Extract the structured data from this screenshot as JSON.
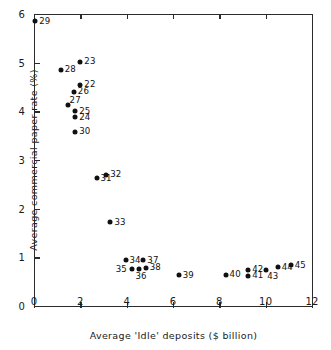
{
  "chart_data": {
    "type": "scatter",
    "title": "",
    "xlabel": "Average 'Idle' deposits ($ billion)",
    "ylabel": "Average commercial paper rate (%)",
    "xlim": [
      0,
      12
    ],
    "ylim": [
      0,
      6
    ],
    "xticks": [
      0,
      2,
      4,
      6,
      8,
      10,
      12
    ],
    "yticks": [
      0,
      1,
      2,
      3,
      4,
      5,
      6
    ],
    "xtick_labels": [
      "0",
      "2",
      "4",
      "6",
      "8",
      "10",
      "12"
    ],
    "ytick_labels": [
      "0",
      "1",
      "2",
      "3",
      "4",
      "5",
      "6"
    ],
    "grid": false,
    "legend": "none",
    "annotations": [
      {
        "type": "hline",
        "y": 3,
        "label": ""
      }
    ],
    "point_labels_shown": true,
    "points": [
      {
        "label": "29",
        "x": 0.05,
        "y": 5.85,
        "label_pos": "right"
      },
      {
        "label": "28",
        "x": 1.15,
        "y": 4.85,
        "label_pos": "right"
      },
      {
        "label": "23",
        "x": 2.0,
        "y": 5.02,
        "label_pos": "right"
      },
      {
        "label": "22",
        "x": 2.0,
        "y": 4.55,
        "label_pos": "right"
      },
      {
        "label": "26",
        "x": 1.72,
        "y": 4.4,
        "label_pos": "right"
      },
      {
        "label": "27",
        "x": 1.45,
        "y": 4.12,
        "label_pos": "upper-right"
      },
      {
        "label": "25",
        "x": 1.78,
        "y": 4.0,
        "label_pos": "right"
      },
      {
        "label": "24",
        "x": 1.78,
        "y": 3.88,
        "label_pos": "right"
      },
      {
        "label": "30",
        "x": 1.78,
        "y": 3.58,
        "label_pos": "right"
      },
      {
        "label": "31",
        "x": 2.7,
        "y": 2.63,
        "label_pos": "right"
      },
      {
        "label": "32",
        "x": 3.12,
        "y": 2.7,
        "label_pos": "right"
      },
      {
        "label": "33",
        "x": 3.3,
        "y": 1.72,
        "label_pos": "right"
      },
      {
        "label": "34",
        "x": 3.95,
        "y": 0.94,
        "label_pos": "right"
      },
      {
        "label": "37",
        "x": 4.72,
        "y": 0.94,
        "label_pos": "right"
      },
      {
        "label": "35",
        "x": 4.22,
        "y": 0.76,
        "label_pos": "left"
      },
      {
        "label": "36",
        "x": 4.55,
        "y": 0.76,
        "label_pos": "below"
      },
      {
        "label": "38",
        "x": 4.82,
        "y": 0.79,
        "label_pos": "right"
      },
      {
        "label": "39",
        "x": 6.25,
        "y": 0.63,
        "label_pos": "right"
      },
      {
        "label": "40",
        "x": 8.27,
        "y": 0.64,
        "label_pos": "right"
      },
      {
        "label": "42",
        "x": 9.25,
        "y": 0.74,
        "label_pos": "right"
      },
      {
        "label": "41",
        "x": 9.25,
        "y": 0.62,
        "label_pos": "right"
      },
      {
        "label": "43",
        "x": 10.02,
        "y": 0.74,
        "label_pos": "below-right"
      },
      {
        "label": "44",
        "x": 10.52,
        "y": 0.8,
        "label_pos": "right"
      },
      {
        "label": "45",
        "x": 11.08,
        "y": 0.84,
        "label_pos": "right"
      }
    ]
  }
}
